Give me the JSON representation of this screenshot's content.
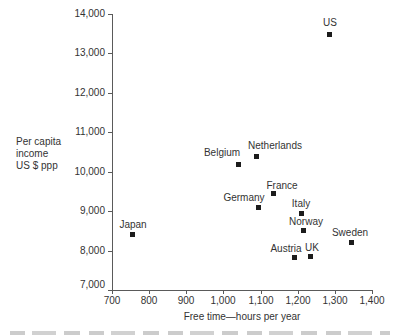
{
  "figure": {
    "background": "#ffffff",
    "text_color": "#333333",
    "axis_color": "#5a5a5a",
    "marker_color": "#1c1c1c"
  },
  "chart_data": {
    "type": "scatter",
    "title": "",
    "xlabel": "Free time—hours per year",
    "ylabel": "Per capita income US $ ppp",
    "ylabel_lines": [
      "Per capita",
      "income",
      "US $ ppp"
    ],
    "xlim": [
      700,
      1400
    ],
    "ylim": [
      7000,
      14000
    ],
    "x_ticks": [
      700,
      800,
      900,
      1000,
      1100,
      1200,
      1300,
      1400
    ],
    "y_ticks": [
      7000,
      8000,
      9000,
      10000,
      11000,
      12000,
      13000,
      14000
    ],
    "grid": false,
    "legend": "none",
    "marker_shape": "square",
    "points": [
      {
        "label": "Japan",
        "x": 755,
        "y": 8400,
        "label_dx": 1,
        "label_dy": -10
      },
      {
        "label": "Belgium",
        "x": 1040,
        "y": 10190,
        "label_dx": -16,
        "label_dy": -11
      },
      {
        "label": "Netherlands",
        "x": 1090,
        "y": 10380,
        "label_dx": 18,
        "label_dy": -11
      },
      {
        "label": "Germany",
        "x": 1095,
        "y": 9100,
        "label_dx": -15,
        "label_dy": -9
      },
      {
        "label": "France",
        "x": 1135,
        "y": 9440,
        "label_dx": 8,
        "label_dy": -8
      },
      {
        "label": "Austria",
        "x": 1190,
        "y": 7830,
        "label_dx": -8,
        "label_dy": -8
      },
      {
        "label": "Italy",
        "x": 1210,
        "y": 8950,
        "label_dx": 0,
        "label_dy": -9
      },
      {
        "label": "Norway",
        "x": 1215,
        "y": 8500,
        "label_dx": 3,
        "label_dy": -9
      },
      {
        "label": "UK",
        "x": 1235,
        "y": 7860,
        "label_dx": 1,
        "label_dy": -8
      },
      {
        "label": "US",
        "x": 1285,
        "y": 13490,
        "label_dx": 1,
        "label_dy": -11
      },
      {
        "label": "Sweden",
        "x": 1345,
        "y": 8210,
        "label_dx": -2,
        "label_dy": -9
      }
    ]
  }
}
